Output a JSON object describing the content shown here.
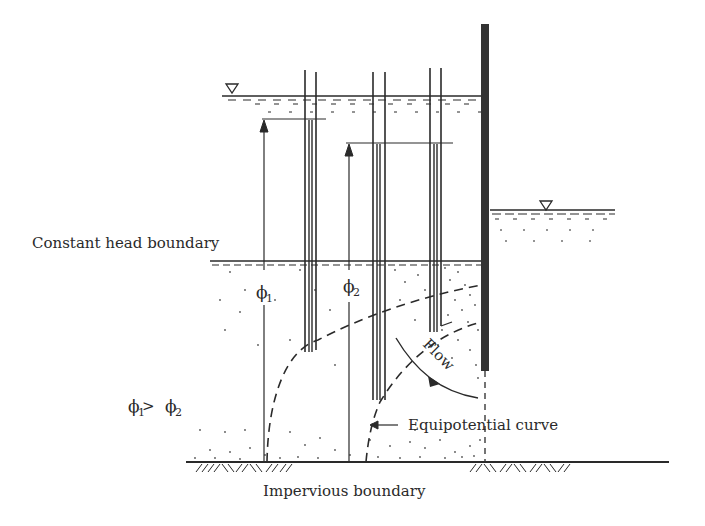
{
  "diagram": {
    "type": "seepage-piezometer-schematic",
    "labels": {
      "constant_head_boundary": "Constant head boundary",
      "impervious_boundary": "Impervious boundary",
      "equipotential_curve": "Equipotential curve",
      "flow": "Flow",
      "phi1": "ϕ",
      "phi1_sub": "1",
      "phi2": "ϕ",
      "phi2_sub": "2",
      "relation_phi_a": "ϕ",
      "relation_sub_a": "1",
      "relation_op": " > ",
      "relation_phi_b": "ϕ",
      "relation_sub_b": "2"
    },
    "symbols": {
      "water_table_left": "water-surface-triangle",
      "water_table_right": "water-surface-triangle"
    },
    "colors": {
      "ink": "#2a2a2a",
      "background": "#ffffff"
    }
  }
}
